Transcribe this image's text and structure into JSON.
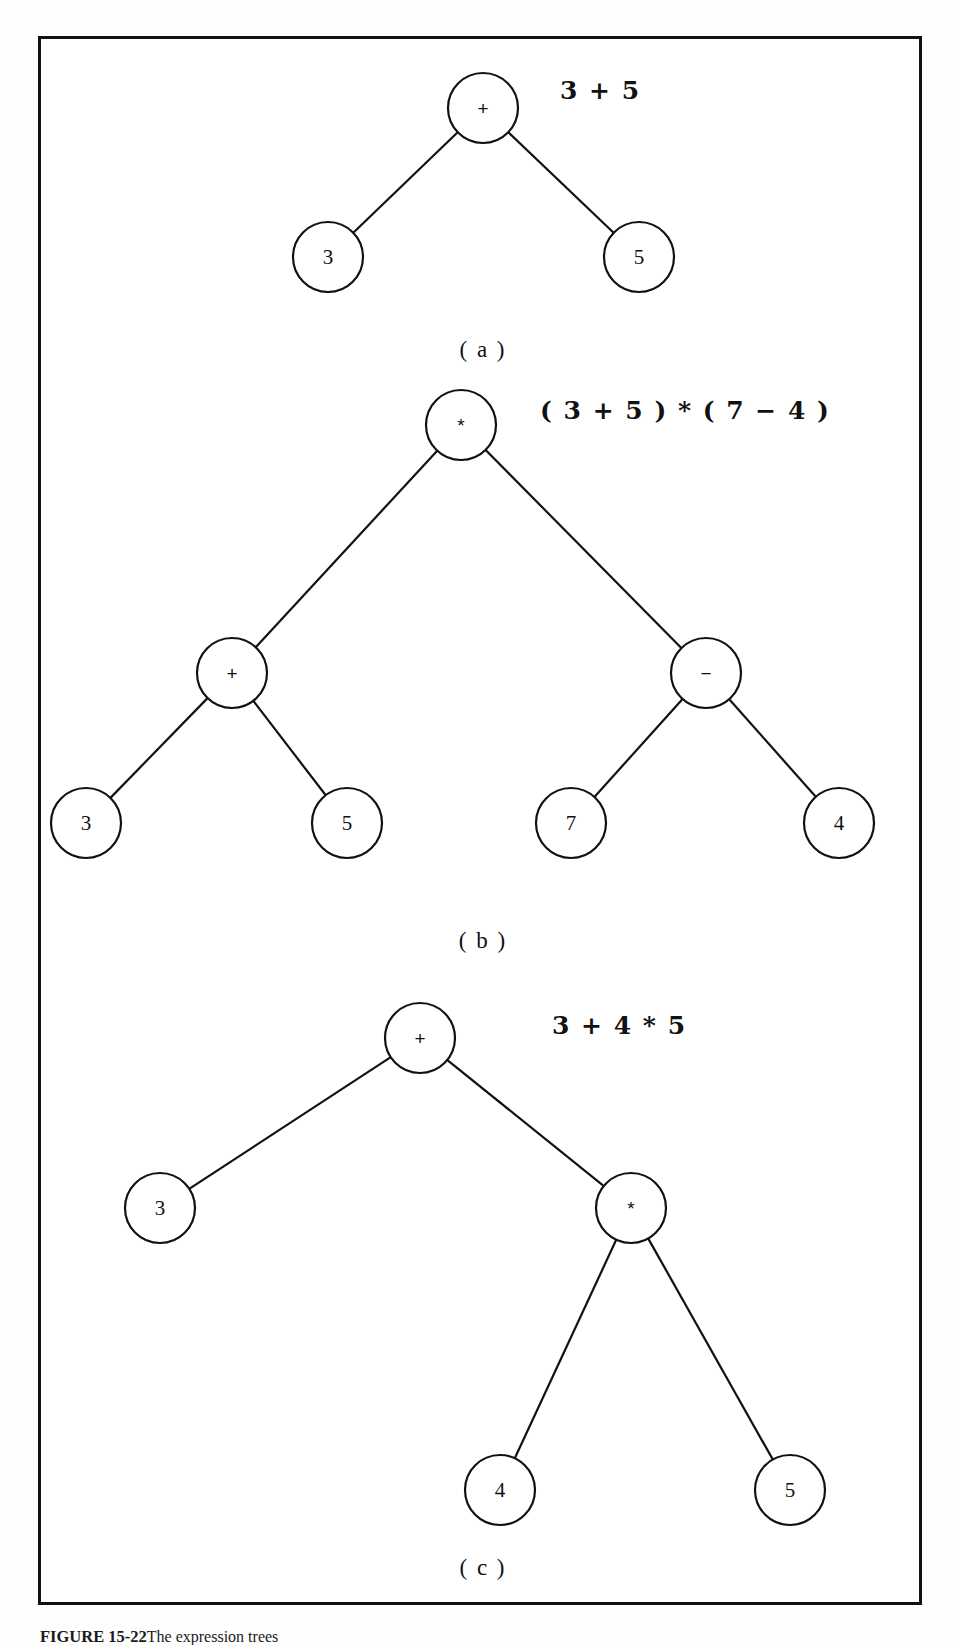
{
  "figure": {
    "caption_label": "FIGURE 15-22",
    "caption_text": "The expression trees",
    "frame_color": "#111111",
    "background_color": "#ffffff"
  },
  "trees": [
    {
      "id": "tree-a",
      "part_label": "( a )",
      "expression": "3 + 5",
      "nodes": [
        {
          "id": "a-root",
          "label": "+",
          "type": "operator",
          "cx": 483,
          "cy": 108,
          "r": 35
        },
        {
          "id": "a-left",
          "label": "3",
          "type": "operand",
          "cx": 328,
          "cy": 257,
          "r": 35
        },
        {
          "id": "a-right",
          "label": "5",
          "type": "operand",
          "cx": 639,
          "cy": 257,
          "r": 35
        }
      ],
      "edges": [
        {
          "from": "a-root",
          "to": "a-left"
        },
        {
          "from": "a-root",
          "to": "a-right"
        }
      ],
      "expr_x": 560,
      "expr_y": 90,
      "label_x": 483,
      "label_y": 350
    },
    {
      "id": "tree-b",
      "part_label": "( b )",
      "expression": "( 3 + 5 ) * ( 7 − 4 )",
      "nodes": [
        {
          "id": "b-root",
          "label": "*",
          "type": "operator",
          "cx": 461,
          "cy": 425,
          "r": 35
        },
        {
          "id": "b-plus",
          "label": "+",
          "type": "operator",
          "cx": 232,
          "cy": 673,
          "r": 35
        },
        {
          "id": "b-minus",
          "label": "−",
          "type": "operator",
          "cx": 706,
          "cy": 673,
          "r": 35
        },
        {
          "id": "b-3",
          "label": "3",
          "type": "operand",
          "cx": 86,
          "cy": 823,
          "r": 35
        },
        {
          "id": "b-5",
          "label": "5",
          "type": "operand",
          "cx": 347,
          "cy": 823,
          "r": 35
        },
        {
          "id": "b-7",
          "label": "7",
          "type": "operand",
          "cx": 571,
          "cy": 823,
          "r": 35
        },
        {
          "id": "b-4",
          "label": "4",
          "type": "operand",
          "cx": 839,
          "cy": 823,
          "r": 35
        }
      ],
      "edges": [
        {
          "from": "b-root",
          "to": "b-plus"
        },
        {
          "from": "b-root",
          "to": "b-minus"
        },
        {
          "from": "b-plus",
          "to": "b-3"
        },
        {
          "from": "b-plus",
          "to": "b-5"
        },
        {
          "from": "b-minus",
          "to": "b-7"
        },
        {
          "from": "b-minus",
          "to": "b-4"
        }
      ],
      "expr_x": 540,
      "expr_y": 410,
      "label_x": 483,
      "label_y": 941
    },
    {
      "id": "tree-c",
      "part_label": "( c )",
      "expression": "3 + 4 * 5",
      "nodes": [
        {
          "id": "c-root",
          "label": "+",
          "type": "operator",
          "cx": 420,
          "cy": 1038,
          "r": 35
        },
        {
          "id": "c-3",
          "label": "3",
          "type": "operand",
          "cx": 160,
          "cy": 1208,
          "r": 35
        },
        {
          "id": "c-star",
          "label": "*",
          "type": "operator",
          "cx": 631,
          "cy": 1208,
          "r": 35
        },
        {
          "id": "c-4",
          "label": "4",
          "type": "operand",
          "cx": 500,
          "cy": 1490,
          "r": 35
        },
        {
          "id": "c-5",
          "label": "5",
          "type": "operand",
          "cx": 790,
          "cy": 1490,
          "r": 35
        }
      ],
      "edges": [
        {
          "from": "c-root",
          "to": "c-3"
        },
        {
          "from": "c-root",
          "to": "c-star"
        },
        {
          "from": "c-star",
          "to": "c-4"
        },
        {
          "from": "c-star",
          "to": "c-5"
        }
      ],
      "expr_x": 552,
      "expr_y": 1025,
      "label_x": 483,
      "label_y": 1568
    }
  ]
}
